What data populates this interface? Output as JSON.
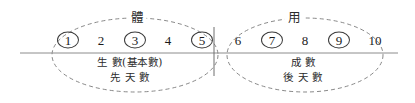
{
  "diagram": {
    "canvas": {
      "width": 415,
      "height": 103,
      "background": "#ffffff"
    },
    "colors": {
      "ink": "#1a1a1a",
      "stroke": "#3a3a3a",
      "dashed_stroke": "#7a7a7a",
      "baseline": "#8c8c8c",
      "divider": "#6e6e6e"
    },
    "axis": {
      "baseline_label": "horizontal-baseline",
      "divider_label": "vertical-divider"
    },
    "groups": [
      {
        "id": "left",
        "cap_label": "體",
        "cap_x": 137,
        "cap_y": 18,
        "ellipse": {
          "cx": 135,
          "cy": 55,
          "rx": 83,
          "ry": 37
        },
        "numbers": [
          {
            "value": "1",
            "circled": true,
            "x": 68
          },
          {
            "value": "2",
            "circled": false,
            "x": 101
          },
          {
            "value": "3",
            "circled": true,
            "x": 135
          },
          {
            "value": "4",
            "circled": false,
            "x": 168
          },
          {
            "value": "5",
            "circled": true,
            "x": 202
          }
        ],
        "descriptions": [
          {
            "text": "生 數(基本數)",
            "x": 130,
            "y": 62
          },
          {
            "text": "先 天 數",
            "x": 130,
            "y": 77
          }
        ]
      },
      {
        "id": "right",
        "cap_label": "用",
        "cap_x": 294,
        "cap_y": 18,
        "ellipse": {
          "cx": 305,
          "cy": 55,
          "rx": 78,
          "ry": 37
        },
        "numbers": [
          {
            "value": "6",
            "circled": false,
            "x": 238
          },
          {
            "value": "7",
            "circled": true,
            "x": 272
          },
          {
            "value": "8",
            "circled": false,
            "x": 305
          },
          {
            "value": "9",
            "circled": true,
            "x": 339
          },
          {
            "value": "10",
            "circled": false,
            "x": 375
          }
        ],
        "descriptions": [
          {
            "text": "成 數",
            "x": 303,
            "y": 62
          },
          {
            "text": "後 天 數",
            "x": 303,
            "y": 77
          }
        ]
      }
    ],
    "number_row_y": 40,
    "baseline": {
      "x1": 20,
      "x2": 398,
      "y": 53
    },
    "divider": {
      "x": 214,
      "y1": 27,
      "y2": 76
    }
  }
}
